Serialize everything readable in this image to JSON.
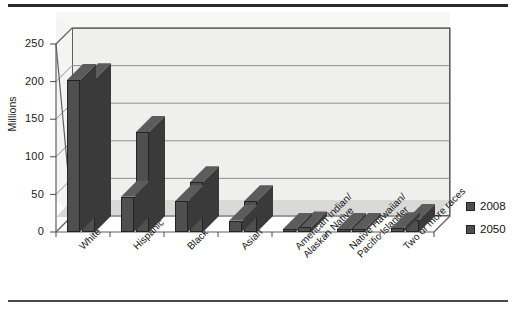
{
  "chart_data": {
    "type": "bar",
    "title": "",
    "subtitle": "",
    "xlabel": "",
    "ylabel": "Millions",
    "ylim": [
      0,
      250
    ],
    "yticks": [
      0,
      50,
      100,
      150,
      200,
      250
    ],
    "grid": true,
    "legend_position": "right",
    "style": "3d-clustered-column",
    "categories": [
      "White",
      "Hispanic",
      "Black",
      "Asian",
      "American Indian/\nAlaskan Native",
      "Native Hawaiian/\nPacific Islander",
      "Two or more races"
    ],
    "category_labels": [
      [
        "White"
      ],
      [
        "Hispanic"
      ],
      [
        "Black"
      ],
      [
        "Asian"
      ],
      [
        "American Indian/",
        "Alaskan Native"
      ],
      [
        "Native Hawaiian/",
        "Pacific Islander"
      ],
      [
        "Two or more races"
      ]
    ],
    "series": [
      {
        "name": "2008",
        "values": [
          202,
          47,
          41,
          15,
          3,
          1,
          5
        ]
      },
      {
        "name": "2050",
        "values": [
          203,
          133,
          66,
          41,
          6,
          3,
          16
        ]
      }
    ],
    "colors": {
      "series_2008": "#4f4f4f",
      "series_2050": "#4f4f4f",
      "bar_side": "#3a3a3a",
      "bar_top": "#5c5c5c",
      "plot_back": "#efefee",
      "plot_floor": "#d9d9d7",
      "gridline": "#8d8d8d",
      "axis": "#5e5e5e",
      "text": "#1a1a1a"
    }
  },
  "axis": {
    "y_tick_labels": [
      "250",
      "200",
      "150",
      "100",
      "50",
      "0"
    ],
    "y_title": "Millions"
  },
  "legend": {
    "items": [
      {
        "label": "2008",
        "color": "#4f4f4f"
      },
      {
        "label": "2050",
        "color": "#4f4f4f"
      }
    ]
  }
}
